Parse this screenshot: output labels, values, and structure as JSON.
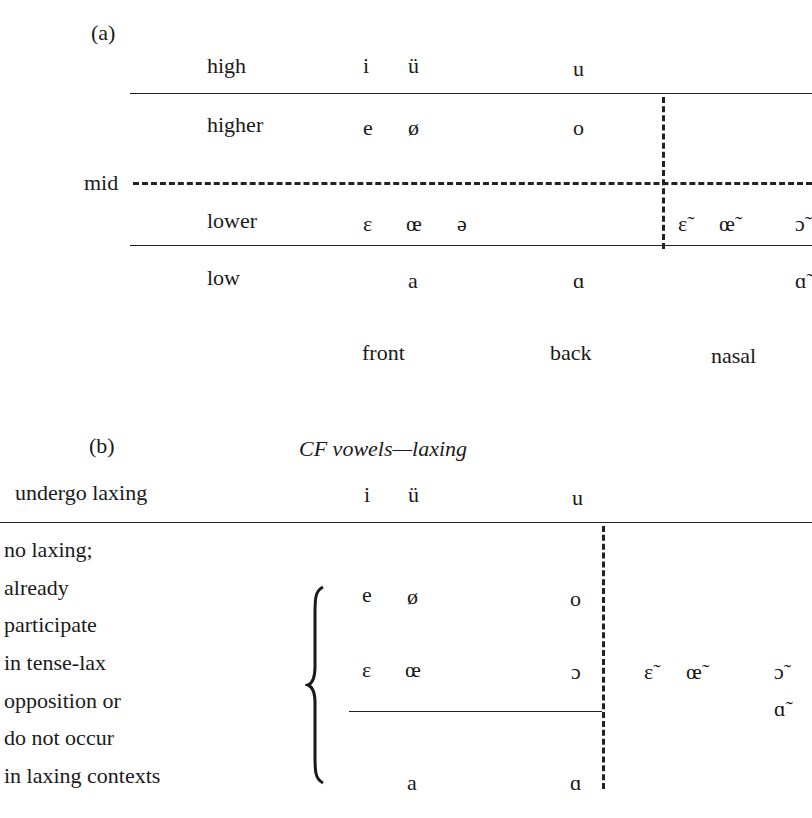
{
  "panel_a": {
    "label": "(a)",
    "mid_label": "mid",
    "rows": [
      {
        "label": "high",
        "front": [
          "i",
          "ü"
        ],
        "back": "u",
        "nasal": []
      },
      {
        "label": "higher",
        "front": [
          "e",
          "ø"
        ],
        "back": "o",
        "nasal": []
      },
      {
        "label": "lower",
        "front": [
          "ɛ",
          "œ",
          "ə"
        ],
        "back": "",
        "nasal": [
          "ɛ̃",
          "œ̃",
          "ɔ̃"
        ]
      },
      {
        "label": "low",
        "front": [
          "a"
        ],
        "back": "ɑ",
        "nasal": [
          "ɑ̃"
        ]
      }
    ],
    "columns": {
      "front": "front",
      "back": "back",
      "nasal": "nasal"
    }
  },
  "panel_b": {
    "label": "(b)",
    "title": "CF vowels—laxing",
    "undergo_label": "undergo laxing",
    "undergo_vowels": {
      "front": [
        "i",
        "ü"
      ],
      "back": "u"
    },
    "no_laxing_lines": [
      "no laxing;",
      "already",
      "participate",
      "in tense-lax",
      "opposition or",
      "do not occur",
      "in laxing contexts"
    ],
    "rows": [
      {
        "front": [
          "e",
          "ø"
        ],
        "back": "o",
        "nasal": []
      },
      {
        "front": [
          "ɛ",
          "œ"
        ],
        "back": "ɔ",
        "nasal": [
          "ɛ̃",
          "œ̃",
          "ɔ̃"
        ]
      },
      {
        "front": [
          "",
          ""
        ],
        "back": "",
        "nasal": [
          "ɑ̃"
        ]
      },
      {
        "front": [
          "a"
        ],
        "back": "ɑ",
        "nasal": []
      }
    ]
  }
}
